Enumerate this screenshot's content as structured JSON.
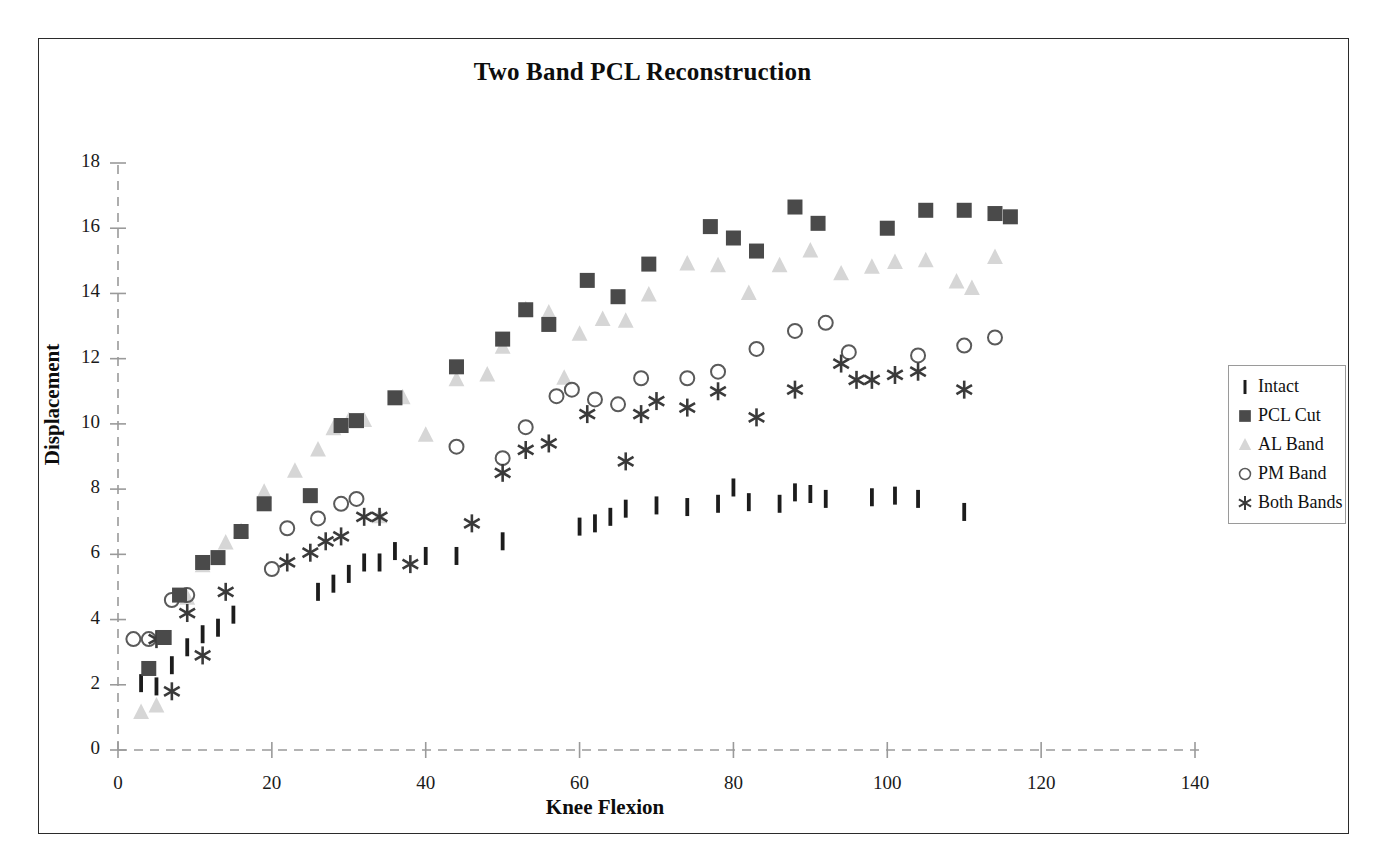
{
  "chart_data": {
    "type": "scatter",
    "title": "Two Band PCL Reconstruction",
    "xlabel": "Knee Flexion",
    "ylabel": "Displacement",
    "xlim": [
      0,
      140
    ],
    "ylim": [
      0,
      18
    ],
    "xticks": [
      0,
      20,
      40,
      60,
      80,
      100,
      120,
      140
    ],
    "yticks": [
      0,
      2,
      4,
      6,
      8,
      10,
      12,
      14,
      16,
      18
    ],
    "grid": false,
    "axis_style": "dashed",
    "legend_position": "right",
    "series": [
      {
        "name": "Intact",
        "marker": "vertical-bar",
        "color": "#1c1c1c",
        "points": [
          [
            3,
            2.05
          ],
          [
            5,
            1.95
          ],
          [
            7,
            2.6
          ],
          [
            9,
            3.15
          ],
          [
            11,
            3.55
          ],
          [
            13,
            3.75
          ],
          [
            15,
            4.15
          ],
          [
            26,
            4.85
          ],
          [
            28,
            5.1
          ],
          [
            30,
            5.4
          ],
          [
            32,
            5.75
          ],
          [
            34,
            5.75
          ],
          [
            36,
            6.1
          ],
          [
            40,
            5.95
          ],
          [
            44,
            5.95
          ],
          [
            50,
            6.4
          ],
          [
            60,
            6.85
          ],
          [
            62,
            6.95
          ],
          [
            64,
            7.15
          ],
          [
            66,
            7.4
          ],
          [
            70,
            7.5
          ],
          [
            74,
            7.45
          ],
          [
            78,
            7.55
          ],
          [
            80,
            8.05
          ],
          [
            82,
            7.6
          ],
          [
            86,
            7.55
          ],
          [
            88,
            7.9
          ],
          [
            90,
            7.85
          ],
          [
            92,
            7.7
          ],
          [
            98,
            7.75
          ],
          [
            101,
            7.8
          ],
          [
            104,
            7.7
          ],
          [
            110,
            7.3
          ]
        ]
      },
      {
        "name": "PCL Cut",
        "marker": "filled-square",
        "color": "#4a4a4a",
        "points": [
          [
            4,
            2.5
          ],
          [
            6,
            3.45
          ],
          [
            8,
            4.75
          ],
          [
            11,
            5.75
          ],
          [
            13,
            5.9
          ],
          [
            16,
            6.7
          ],
          [
            19,
            7.55
          ],
          [
            25,
            7.8
          ],
          [
            29,
            9.95
          ],
          [
            31,
            10.1
          ],
          [
            36,
            10.8
          ],
          [
            44,
            11.75
          ],
          [
            50,
            12.6
          ],
          [
            53,
            13.5
          ],
          [
            56,
            13.05
          ],
          [
            61,
            14.4
          ],
          [
            65,
            13.9
          ],
          [
            69,
            14.9
          ],
          [
            77,
            16.05
          ],
          [
            80,
            15.7
          ],
          [
            83,
            15.3
          ],
          [
            88,
            16.65
          ],
          [
            91,
            16.15
          ],
          [
            100,
            16.0
          ],
          [
            105,
            16.55
          ],
          [
            110,
            16.55
          ],
          [
            114,
            16.45
          ],
          [
            116,
            16.35
          ]
        ]
      },
      {
        "name": "AL Band",
        "marker": "triangle",
        "color": "#d6d6d6",
        "points": [
          [
            3,
            1.15
          ],
          [
            5,
            1.35
          ],
          [
            9,
            4.65
          ],
          [
            11,
            5.65
          ],
          [
            14,
            6.35
          ],
          [
            16,
            6.7
          ],
          [
            19,
            7.9
          ],
          [
            23,
            8.55
          ],
          [
            26,
            9.2
          ],
          [
            28,
            9.85
          ],
          [
            30,
            10.1
          ],
          [
            32,
            10.1
          ],
          [
            34,
            7.15
          ],
          [
            37,
            10.8
          ],
          [
            40,
            9.65
          ],
          [
            44,
            11.35
          ],
          [
            48,
            11.5
          ],
          [
            50,
            12.35
          ],
          [
            53,
            13.5
          ],
          [
            56,
            13.4
          ],
          [
            58,
            11.4
          ],
          [
            60,
            12.75
          ],
          [
            63,
            13.2
          ],
          [
            66,
            13.15
          ],
          [
            69,
            13.95
          ],
          [
            74,
            14.9
          ],
          [
            78,
            14.85
          ],
          [
            82,
            14.0
          ],
          [
            86,
            14.85
          ],
          [
            90,
            15.3
          ],
          [
            94,
            14.6
          ],
          [
            98,
            14.8
          ],
          [
            101,
            14.95
          ],
          [
            105,
            15.0
          ],
          [
            109,
            14.35
          ],
          [
            111,
            14.15
          ],
          [
            114,
            15.1
          ]
        ]
      },
      {
        "name": "PM Band",
        "marker": "open-circle",
        "color": "#5a5a5a",
        "points": [
          [
            2,
            3.4
          ],
          [
            4,
            3.4
          ],
          [
            7,
            4.6
          ],
          [
            9,
            4.75
          ],
          [
            20,
            5.55
          ],
          [
            22,
            6.8
          ],
          [
            26,
            7.1
          ],
          [
            29,
            7.55
          ],
          [
            31,
            7.7
          ],
          [
            44,
            9.3
          ],
          [
            50,
            8.95
          ],
          [
            53,
            9.9
          ],
          [
            57,
            10.85
          ],
          [
            59,
            11.05
          ],
          [
            62,
            10.75
          ],
          [
            65,
            10.6
          ],
          [
            68,
            11.4
          ],
          [
            74,
            11.4
          ],
          [
            78,
            11.6
          ],
          [
            83,
            12.3
          ],
          [
            88,
            12.85
          ],
          [
            92,
            13.1
          ],
          [
            95,
            12.2
          ],
          [
            104,
            12.1
          ],
          [
            110,
            12.4
          ],
          [
            114,
            12.65
          ]
        ]
      },
      {
        "name": "Both Bands",
        "marker": "asterisk",
        "color": "#3a3a3a",
        "points": [
          [
            5,
            3.4
          ],
          [
            7,
            1.8
          ],
          [
            9,
            4.2
          ],
          [
            11,
            2.9
          ],
          [
            14,
            4.85
          ],
          [
            22,
            5.75
          ],
          [
            25,
            6.05
          ],
          [
            27,
            6.4
          ],
          [
            29,
            6.55
          ],
          [
            32,
            7.15
          ],
          [
            34,
            7.15
          ],
          [
            38,
            5.7
          ],
          [
            46,
            6.95
          ],
          [
            50,
            8.5
          ],
          [
            53,
            9.2
          ],
          [
            56,
            9.4
          ],
          [
            61,
            10.3
          ],
          [
            66,
            8.85
          ],
          [
            68,
            10.3
          ],
          [
            70,
            10.7
          ],
          [
            74,
            10.5
          ],
          [
            78,
            11.0
          ],
          [
            83,
            10.2
          ],
          [
            88,
            11.05
          ],
          [
            94,
            11.85
          ],
          [
            96,
            11.35
          ],
          [
            98,
            11.35
          ],
          [
            101,
            11.5
          ],
          [
            104,
            11.6
          ],
          [
            110,
            11.05
          ]
        ]
      }
    ]
  },
  "legend": {
    "items": [
      {
        "label": "Intact",
        "marker": "vertical-bar"
      },
      {
        "label": "PCL Cut",
        "marker": "filled-square"
      },
      {
        "label": "AL Band",
        "marker": "triangle"
      },
      {
        "label": "PM Band",
        "marker": "open-circle"
      },
      {
        "label": "Both Bands",
        "marker": "asterisk"
      }
    ]
  },
  "colors": {
    "intact": "#1c1c1c",
    "pcl_cut": "#4a4a4a",
    "al_band": "#d6d6d6",
    "pm_band": "#5a5a5a",
    "both_bands": "#3a3a3a",
    "axis": "#9a9a9a",
    "frame": "#2b2b2b",
    "text": "#0d0d0d"
  }
}
